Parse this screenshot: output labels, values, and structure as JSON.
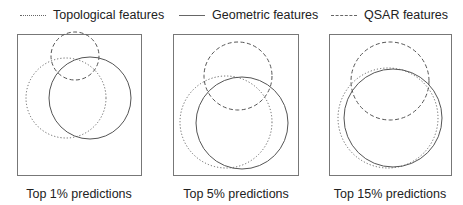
{
  "legend": [
    {
      "label": "Topological features",
      "style": "dotted"
    },
    {
      "label": "Geometric features",
      "style": "solid"
    },
    {
      "label": "QSAR features",
      "style": "dashed"
    }
  ],
  "panels": [
    {
      "label": "Top 1% predictions",
      "box": {
        "x": 17,
        "y": 34,
        "w": 124,
        "h": 141
      },
      "circles": {
        "topological": {
          "cx": 66,
          "cy": 98,
          "r": 40
        },
        "geometric": {
          "cx": 90,
          "cy": 98,
          "r": 41
        },
        "qsar": {
          "cx": 75,
          "cy": 56,
          "r": 24
        }
      }
    },
    {
      "label": "Top 5% predictions",
      "box": {
        "x": 173,
        "y": 34,
        "w": 125,
        "h": 141
      },
      "circles": {
        "topological": {
          "cx": 226,
          "cy": 122,
          "r": 46
        },
        "geometric": {
          "cx": 242,
          "cy": 123,
          "r": 46
        },
        "qsar": {
          "cx": 238,
          "cy": 76,
          "r": 34
        }
      }
    },
    {
      "label": "Top 15% predictions",
      "box": {
        "x": 329,
        "y": 34,
        "w": 122,
        "h": 141
      },
      "circles": {
        "topological": {
          "cx": 388,
          "cy": 118,
          "r": 50
        },
        "geometric": {
          "cx": 393,
          "cy": 118,
          "r": 49
        },
        "qsar": {
          "cx": 390,
          "cy": 81,
          "r": 39
        }
      }
    }
  ],
  "colors": {
    "stroke": "#555555",
    "box": "#777777",
    "text": "#222222"
  }
}
